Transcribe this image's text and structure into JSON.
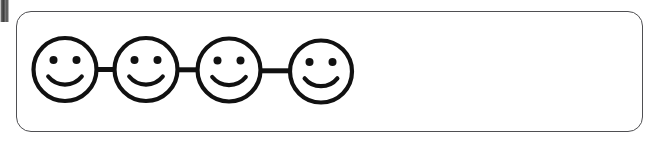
{
  "canvas": {
    "width": 655,
    "height": 144,
    "background_color": "#ffffff"
  },
  "panel": {
    "name": "rounded-rectangle-container",
    "border_color": "#4f4f52",
    "border_width": 1.4,
    "corner_radius": 15,
    "fill_color": "#ffffff",
    "x": 16,
    "y": 11,
    "width": 627,
    "height": 121
  },
  "corner_artifact": {
    "label": "scan-artifact-mark",
    "x": 0,
    "y": 0,
    "width": 9,
    "height": 22,
    "color": "#2e2e2e"
  },
  "face_chain": {
    "label": "linked smiley face chain",
    "count": 4,
    "stroke_color": "#111111",
    "fill_color": "#ffffff",
    "eye_color": "#111111",
    "outline_width": 4.2,
    "connector_width": 5.0,
    "faces": [
      {
        "label": "smiley-face-1",
        "cx": 65,
        "cy": 69.5,
        "r": 31.5,
        "eye_dx": 11.5,
        "eye_dy": -9.5,
        "eye_r": 4.0,
        "smile_r": 21.5,
        "smile_spread": 0.78
      },
      {
        "label": "smiley-face-2",
        "cx": 146,
        "cy": 69.5,
        "r": 31.5,
        "eye_dx": 11.5,
        "eye_dy": -9.5,
        "eye_r": 4.0,
        "smile_r": 21.5,
        "smile_spread": 0.78
      },
      {
        "label": "smiley-face-3",
        "cx": 229,
        "cy": 70.0,
        "r": 31.5,
        "eye_dx": 11.5,
        "eye_dy": -9.5,
        "eye_r": 4.0,
        "smile_r": 21.5,
        "smile_spread": 0.78
      },
      {
        "label": "smiley-face-4",
        "cx": 321,
        "cy": 71.5,
        "r": 31.0,
        "eye_dx": 11.5,
        "eye_dy": -9.5,
        "eye_r": 4.0,
        "smile_r": 21.0,
        "smile_spread": 0.78
      }
    ],
    "connectors": [
      {
        "label": "connector-1-2",
        "x1": 96,
        "x2": 115,
        "y": 69.5
      },
      {
        "label": "connector-2-3",
        "x1": 177,
        "x2": 198,
        "y": 69.8
      },
      {
        "label": "connector-3-4",
        "x1": 260,
        "x2": 291,
        "y": 70.8
      }
    ]
  }
}
